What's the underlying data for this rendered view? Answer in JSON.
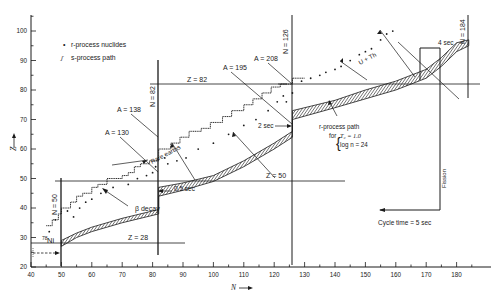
{
  "chart_data": {
    "type": "scatter",
    "title": "",
    "xlabel": "N",
    "ylabel": "Z",
    "xlim": [
      40,
      187
    ],
    "ylim": [
      20,
      105
    ],
    "x_ticks": [
      40,
      50,
      60,
      70,
      80,
      90,
      100,
      110,
      120,
      130,
      140,
      150,
      160,
      170,
      180
    ],
    "y_ticks": [
      20,
      30,
      40,
      50,
      60,
      70,
      80,
      90,
      100
    ],
    "grid": false,
    "legend": {
      "position": "upper-left",
      "entries": [
        {
          "symbol": "•",
          "label": "r-process nuclides"
        },
        {
          "symbol": "ʃ",
          "label": "s-process path"
        }
      ]
    },
    "magic_lines": {
      "neutron": [
        {
          "label": "N = 50",
          "N": 50
        },
        {
          "label": "N = 82",
          "N": 82
        },
        {
          "label": "N = 126",
          "N": 126
        },
        {
          "label": "N = 184",
          "N": 184
        }
      ],
      "proton": [
        {
          "label": "Z = 28",
          "Z": 28
        },
        {
          "label": "Z = 50",
          "Z": 50
        },
        {
          "label": "Z = 82",
          "Z": 82
        }
      ]
    },
    "r_process_path_band": {
      "label": "r-process path",
      "conditions": [
        "T9 = 1.0",
        "log n = 24"
      ],
      "lower": [
        [
          50,
          27
        ],
        [
          55,
          30
        ],
        [
          60,
          32
        ],
        [
          70,
          35
        ],
        [
          82,
          38
        ],
        [
          82,
          44
        ],
        [
          90,
          46
        ],
        [
          100,
          49
        ],
        [
          110,
          54
        ],
        [
          120,
          60
        ],
        [
          126,
          64
        ],
        [
          126,
          70
        ],
        [
          140,
          74
        ],
        [
          150,
          77
        ],
        [
          160,
          80
        ],
        [
          170,
          84
        ],
        [
          175,
          88
        ],
        [
          180,
          93
        ],
        [
          184,
          95
        ]
      ],
      "upper": [
        [
          50,
          29
        ],
        [
          55,
          31.5
        ],
        [
          60,
          33.5
        ],
        [
          70,
          36.5
        ],
        [
          82,
          39.5
        ],
        [
          82,
          47
        ],
        [
          90,
          48.5
        ],
        [
          100,
          51
        ],
        [
          110,
          56
        ],
        [
          120,
          62
        ],
        [
          126,
          66
        ],
        [
          126,
          73
        ],
        [
          140,
          76.5
        ],
        [
          150,
          80
        ],
        [
          160,
          83
        ],
        [
          170,
          87
        ],
        [
          175,
          91
        ],
        [
          180,
          96
        ],
        [
          184,
          97
        ]
      ]
    },
    "s_process_path": [
      [
        45,
        34
      ],
      [
        47,
        34
      ],
      [
        47,
        36
      ],
      [
        49,
        36
      ],
      [
        49,
        38
      ],
      [
        50,
        38
      ],
      [
        50,
        40
      ],
      [
        53,
        40
      ],
      [
        53,
        42
      ],
      [
        55,
        42
      ],
      [
        55,
        44
      ],
      [
        57,
        44
      ],
      [
        57,
        45
      ],
      [
        60,
        45
      ],
      [
        60,
        47
      ],
      [
        62,
        47
      ],
      [
        62,
        48
      ],
      [
        65,
        48
      ],
      [
        65,
        50
      ],
      [
        70,
        50
      ],
      [
        70,
        51
      ],
      [
        72,
        51
      ],
      [
        72,
        52
      ],
      [
        74,
        52
      ],
      [
        74,
        54
      ],
      [
        76,
        54
      ],
      [
        76,
        55
      ],
      [
        79,
        55
      ],
      [
        79,
        56
      ],
      [
        82,
        56
      ],
      [
        82,
        60
      ],
      [
        86,
        60
      ],
      [
        86,
        62
      ],
      [
        89,
        62
      ],
      [
        89,
        64
      ],
      [
        92,
        64
      ],
      [
        92,
        66
      ],
      [
        96,
        66
      ],
      [
        96,
        67
      ],
      [
        99,
        67
      ],
      [
        99,
        69
      ],
      [
        103,
        69
      ],
      [
        103,
        71
      ],
      [
        106,
        71
      ],
      [
        106,
        73
      ],
      [
        110,
        73
      ],
      [
        110,
        75
      ],
      [
        113,
        75
      ],
      [
        113,
        77
      ],
      [
        116,
        77
      ],
      [
        116,
        79
      ],
      [
        119,
        79
      ],
      [
        119,
        81
      ],
      [
        122,
        81
      ],
      [
        122,
        82
      ],
      [
        126,
        82
      ],
      [
        126,
        84
      ],
      [
        130,
        84
      ]
    ],
    "r_process_nuclides": [
      [
        46,
        33
      ],
      [
        48,
        37
      ],
      [
        52,
        40
      ],
      [
        54,
        38
      ],
      [
        56,
        41
      ],
      [
        58,
        43
      ],
      [
        60,
        44
      ],
      [
        63,
        46
      ],
      [
        67,
        48
      ],
      [
        72,
        49
      ],
      [
        75,
        51
      ],
      [
        78,
        52
      ],
      [
        80,
        53
      ],
      [
        81,
        55
      ],
      [
        84,
        58
      ],
      [
        85,
        56
      ],
      [
        88,
        57
      ],
      [
        91,
        58
      ],
      [
        95,
        61
      ],
      [
        100,
        63
      ],
      [
        105,
        66
      ],
      [
        110,
        69
      ],
      [
        114,
        71
      ],
      [
        118,
        74
      ],
      [
        121,
        77
      ],
      [
        123,
        79
      ],
      [
        124,
        77
      ],
      [
        126,
        80
      ],
      [
        129,
        84
      ],
      [
        132,
        85
      ],
      [
        135,
        86
      ],
      [
        137,
        87
      ],
      [
        140,
        88
      ],
      [
        142,
        89
      ],
      [
        145,
        91
      ],
      [
        148,
        93
      ],
      [
        150,
        94
      ],
      [
        152,
        95
      ],
      [
        155,
        98
      ],
      [
        157,
        100
      ],
      [
        159,
        101
      ]
    ],
    "annotations": [
      {
        "text": "A = 130",
        "target": [
          82,
          48
        ]
      },
      {
        "text": "A = 138",
        "target": [
          82,
          56
        ]
      },
      {
        "text": "A = 195",
        "target": [
          118,
          77
        ]
      },
      {
        "text": "A = 208",
        "target": [
          126,
          82
        ]
      },
      {
        "text": "β decay",
        "arrow": "points toward stability"
      },
      {
        "text": "Rare earths",
        "span": [
          [
            60,
            47
          ],
          [
            105,
            62
          ]
        ]
      },
      {
        "text": "U + Th",
        "span": [
          [
            140,
            88
          ],
          [
            160,
            96
          ]
        ]
      },
      {
        "text": "0.5 sec",
        "at": [
          82,
          45
        ]
      },
      {
        "text": "2 sec",
        "at": [
          126,
          68
        ]
      },
      {
        "text": "4 sec",
        "at": [
          175,
          93
        ]
      },
      {
        "text": "Fission",
        "at": [
          175,
          60
        ]
      },
      {
        "text": "Cycle time = 5 sec"
      },
      {
        "text": "78Ni",
        "at": [
          48,
          28
        ]
      }
    ]
  },
  "labels": {
    "legend_dot": "•",
    "legend_r": "r-process nuclides",
    "legend_s_glyph": "ʃ",
    "legend_s": "s-process path",
    "ylabel": "Z",
    "xlabel": "N",
    "n50": "N = 50",
    "n82": "N = 82",
    "n126": "N = 126",
    "n184": "N = 184",
    "z28": "Z = 28",
    "z50": "Z = 50",
    "z82": "Z = 82",
    "a130": "A = 130",
    "a138": "A = 138",
    "a195": "A = 195",
    "a208": "A = 208",
    "beta": "β decay",
    "rare": "Rare earths",
    "uth": "U + Th",
    "t05": "0.5 sec",
    "t2": "2 sec",
    "t4": "4 sec",
    "fission": "Fission",
    "cycle": "Cycle time = 5 sec",
    "rpath1": "r-process path",
    "rpath2": "for",
    "rpath3": "T₉ = 1.0",
    "rpath4": "log n = 24",
    "ni78_mass": "78",
    "ni78_el": "Ni"
  },
  "colors": {
    "ink": "#1a1a1a",
    "background": "#ffffff"
  }
}
